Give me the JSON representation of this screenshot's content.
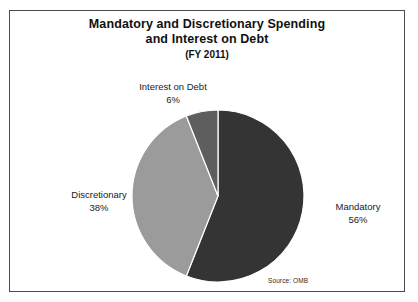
{
  "figure": {
    "source_note": "Source: OMB",
    "border_color": "#4a4a4a",
    "background": "#ffffff"
  },
  "chart_data": {
    "type": "pie",
    "title": "Mandatory and Discretionary Spending and Interest on Debt (FY 2011)",
    "title_line1": "Mandatory and Discretionary Spending",
    "title_line2": "and Interest on Debt",
    "title_line3": "(FY 2011)",
    "xlabel": "",
    "ylabel": "",
    "legend_position": "none",
    "grid": false,
    "start_angle_deg": 0,
    "direction": "clockwise",
    "categories": [
      "Mandatory",
      "Discretionary",
      "Interest on Debt"
    ],
    "values": [
      56,
      38,
      6
    ],
    "unit": "%",
    "slices": [
      {
        "name": "Mandatory",
        "value": 56,
        "label": "Mandatory",
        "pct_label": "56%",
        "color": "#343434"
      },
      {
        "name": "Discretionary",
        "value": 38,
        "label": "Discretionary",
        "pct_label": "38%",
        "color": "#9b9b9b"
      },
      {
        "name": "Interest on Debt",
        "value": 6,
        "label": "Interest on Debt",
        "pct_label": "6%",
        "color": "#5e5e5e"
      }
    ]
  }
}
